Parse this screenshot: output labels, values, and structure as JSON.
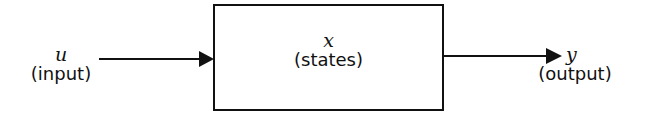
{
  "diagram": {
    "type": "block-diagram",
    "input": {
      "symbol": "u",
      "label": "(input)"
    },
    "block": {
      "symbol": "x",
      "label": "(states)"
    },
    "output": {
      "symbol": "y",
      "label": "(output)"
    },
    "colors": {
      "line": "#111111",
      "background": "#ffffff"
    }
  }
}
